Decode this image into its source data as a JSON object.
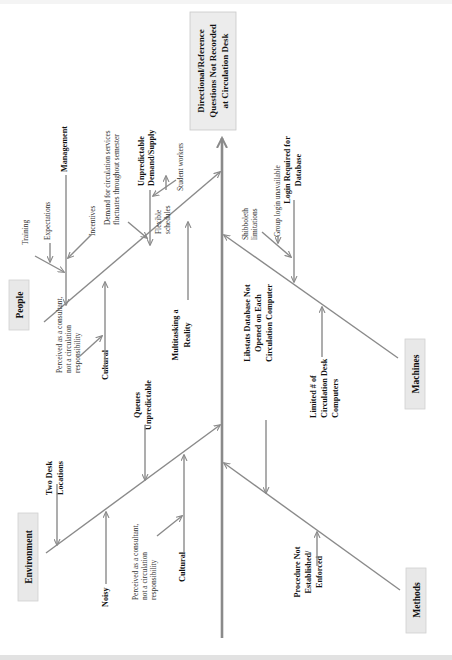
{
  "diagram": {
    "type": "fishbone",
    "orientation": "rotated-90-ccw",
    "effect": {
      "lines": [
        "Directional/Reference",
        "Questions Not Recorded",
        "at Circulation Desk"
      ]
    },
    "categories": {
      "people": {
        "label": "People",
        "causes": {
          "management": {
            "label": "Management",
            "sub": [
              "Training",
              "Expectations",
              "Incentives"
            ]
          },
          "demand": {
            "lines": [
              "Unpredictable",
              "Demand/Supply"
            ],
            "sub_demand": [
              "Demand for circulation services",
              "fluctuates throughout semester"
            ],
            "flexible": [
              "Flexible",
              "schedules"
            ],
            "student_workers": "Student workers"
          },
          "cultural": {
            "label": "Cultural",
            "sub": [
              "Perceived as a consultant,",
              "not a circulation",
              "responsibility"
            ]
          },
          "multitasking": {
            "lines": [
              "Multitasking a",
              "Reality"
            ]
          }
        }
      },
      "environment": {
        "label": "Environment",
        "causes": {
          "two_desk": {
            "lines": [
              "Two Desk",
              "Locations"
            ]
          },
          "queues": {
            "lines": [
              "Queues",
              "Unpredictable"
            ]
          },
          "noisy": {
            "label": "Noisy"
          },
          "cultural": {
            "label": "Cultural",
            "sub": [
              "Perceived as a consultant,",
              "not a circulation",
              "responsibility"
            ]
          }
        }
      },
      "machines": {
        "label": "Machines",
        "causes": {
          "login": {
            "lines": [
              "Login Required for",
              "Database"
            ],
            "sub": [
              "Shibboleth",
              "limitations"
            ],
            "group": "Group login unavailable"
          },
          "limited": {
            "lines": [
              "Limited # of",
              "Circulation Desk",
              "Computers"
            ]
          }
        }
      },
      "methods": {
        "label": "Methods",
        "causes": {
          "libstats": {
            "lines": [
              "Libstats Database Not",
              "Opened on Each",
              "Circulation Computer"
            ]
          },
          "procedure": {
            "lines": [
              "Procedure Not",
              "Established/",
              "Enforced"
            ]
          }
        }
      }
    }
  }
}
